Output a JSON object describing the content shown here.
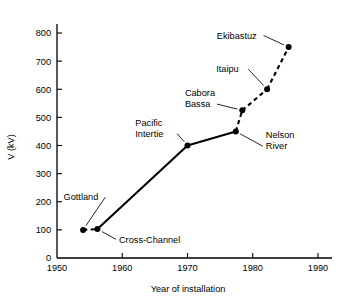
{
  "chart_data": {
    "type": "line",
    "title": "",
    "xlabel": "Year of installation",
    "ylabel": "V (kV)",
    "xlim": [
      1950,
      1992
    ],
    "ylim": [
      0,
      830
    ],
    "xticks": [
      1950,
      1960,
      1970,
      1980,
      1990
    ],
    "xtick_labels": [
      "1950",
      "1960",
      "1970",
      "1980",
      "1990"
    ],
    "yticks": [
      0,
      100,
      200,
      300,
      400,
      500,
      600,
      700,
      800
    ],
    "ytick_labels": [
      "0",
      "100",
      "200",
      "300",
      "400",
      "500",
      "600",
      "700",
      "800"
    ],
    "grid": false,
    "legend": "none",
    "points": [
      {
        "name": "Gottland",
        "x": 1954.0,
        "y": 100,
        "label": "Gottland",
        "label_x": 1951.0,
        "label_y": 205,
        "label_anchor": "start",
        "leader": true
      },
      {
        "name": "Cross-Channel",
        "x": 1956.2,
        "y": 103,
        "label": "Cross-Channel",
        "label_x": 1959.5,
        "label_y": 55,
        "label_anchor": "start",
        "leader": true
      },
      {
        "name": "Pacific Intertie",
        "x": 1970.0,
        "y": 400,
        "label": "Pacific\nIntertie",
        "label_x": 1962.0,
        "label_y": 470,
        "label_anchor": "start",
        "leader": true
      },
      {
        "name": "Nelson River",
        "x": 1977.4,
        "y": 450,
        "label": "Nelson\nRiver",
        "label_x": 1982.0,
        "label_y": 425,
        "label_anchor": "start",
        "leader": true
      },
      {
        "name": "Cabora Bassa",
        "x": 1978.4,
        "y": 525,
        "label": "Cabora\nBassa",
        "label_x": 1969.6,
        "label_y": 575,
        "label_anchor": "start",
        "leader": true
      },
      {
        "name": "Itaipu",
        "x": 1982.2,
        "y": 600,
        "label": "Itaipu",
        "label_x": 1974.4,
        "label_y": 660,
        "label_anchor": "start",
        "leader": true
      },
      {
        "name": "Ekibastuz",
        "x": 1985.5,
        "y": 750,
        "label": "Ekibastuz",
        "label_x": 1974.5,
        "label_y": 780,
        "label_anchor": "start",
        "leader": true
      }
    ],
    "segments": [
      {
        "from": "Gottland",
        "to": "Cross-Channel",
        "style": "dashed"
      },
      {
        "from": "Cross-Channel",
        "to": "Pacific Intertie",
        "style": "solid"
      },
      {
        "from": "Pacific Intertie",
        "to": "Nelson River",
        "style": "solid"
      },
      {
        "from": "Nelson River",
        "to": "Cabora Bassa",
        "style": "dashed"
      },
      {
        "from": "Cabora Bassa",
        "to": "Itaipu",
        "style": "dashed"
      },
      {
        "from": "Itaipu",
        "to": "Ekibastuz",
        "style": "dashed"
      }
    ]
  }
}
